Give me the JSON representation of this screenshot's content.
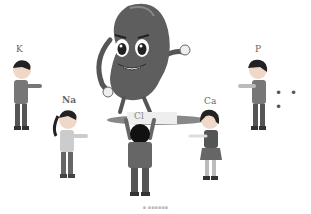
{
  "illustration": {
    "description": "Cartoon kidney character standing on top of a child, surrounded by children representing ions",
    "kidney": {
      "label": "kidney-character",
      "color": "#5a5a5a"
    },
    "children": [
      {
        "label": "K",
        "position": "left-top"
      },
      {
        "label": "Na",
        "position": "left-bottom"
      },
      {
        "label": "Cl",
        "position": "center"
      },
      {
        "label": "Ca",
        "position": "right-bottom"
      },
      {
        "label": "P",
        "position": "right-top"
      }
    ],
    "ellipsis": "• • •",
    "caption": "▪ ▪▪▪▪▪▪"
  }
}
